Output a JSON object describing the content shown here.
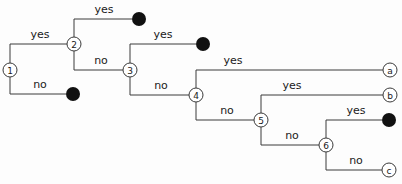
{
  "diagram": {
    "type": "binary-decision-tree",
    "width": 402,
    "height": 184,
    "background_color": "#fdfdfd",
    "line_color": "#3a3a3a",
    "text_color": "#1a1a1a",
    "filled_leaf_color": "#111111",
    "node_fill_color": "#ffffff"
  },
  "labels": {
    "yes": "yes",
    "no": "no"
  },
  "decision_nodes": [
    {
      "id": "n1",
      "label": "1",
      "x": 10,
      "y": 70,
      "r": 7
    },
    {
      "id": "n2",
      "label": "2",
      "x": 74,
      "y": 44,
      "r": 7
    },
    {
      "id": "n3",
      "label": "3",
      "x": 130,
      "y": 70,
      "r": 7
    },
    {
      "id": "n4",
      "label": "4",
      "x": 196,
      "y": 95,
      "r": 7
    },
    {
      "id": "n5",
      "label": "5",
      "x": 261,
      "y": 120,
      "r": 7
    },
    {
      "id": "n6",
      "label": "6",
      "x": 326,
      "y": 145,
      "r": 7
    }
  ],
  "open_leaves": [
    {
      "id": "la",
      "label": "a",
      "x": 390,
      "y": 70,
      "r": 7
    },
    {
      "id": "lb",
      "label": "b",
      "x": 390,
      "y": 95,
      "r": 7
    },
    {
      "id": "lc",
      "label": "c",
      "x": 389,
      "y": 170,
      "r": 7
    }
  ],
  "filled_leaves": [
    {
      "id": "d1",
      "x": 139,
      "y": 19,
      "r": 7
    },
    {
      "id": "d2",
      "x": 73,
      "y": 94,
      "r": 7
    },
    {
      "id": "d3",
      "x": 203,
      "y": 44,
      "r": 7
    },
    {
      "id": "d4",
      "x": 389,
      "y": 120,
      "r": 7
    }
  ],
  "edges": [
    {
      "id": "e1",
      "from": "n1",
      "to": "n2",
      "branch": "yes",
      "path": "M 10 63 L 10 44 L 67 44",
      "label_x": 40,
      "label_y": 38
    },
    {
      "id": "e2",
      "from": "n1",
      "to": "d2",
      "branch": "no",
      "path": "M 10 77 L 10 94 L 66 94",
      "label_x": 40,
      "label_y": 88
    },
    {
      "id": "e3",
      "from": "n2",
      "to": "d1",
      "branch": "yes",
      "path": "M 74 37 L 74 19 L 132 19",
      "label_x": 104,
      "label_y": 13
    },
    {
      "id": "e4",
      "from": "n2",
      "to": "n3",
      "branch": "no",
      "path": "M 74 51 L 74 70 L 123 70",
      "label_x": 101,
      "label_y": 64
    },
    {
      "id": "e5",
      "from": "n3",
      "to": "d3",
      "branch": "yes",
      "path": "M 130 63 L 130 44 L 196 44",
      "label_x": 163,
      "label_y": 38
    },
    {
      "id": "e6",
      "from": "n3",
      "to": "n4",
      "branch": "no",
      "path": "M 130 77 L 130 95 L 189 95",
      "label_x": 161,
      "label_y": 89
    },
    {
      "id": "e7",
      "from": "n4",
      "to": "la",
      "branch": "yes",
      "path": "M 196 88 L 196 70 L 383 70",
      "label_x": 233,
      "label_y": 64
    },
    {
      "id": "e8",
      "from": "n4",
      "to": "n5",
      "branch": "no",
      "path": "M 196 102 L 196 120 L 254 120",
      "label_x": 227,
      "label_y": 114
    },
    {
      "id": "e9",
      "from": "n5",
      "to": "lb",
      "branch": "yes",
      "path": "M 261 113 L 261 95 L 383 95",
      "label_x": 292,
      "label_y": 89
    },
    {
      "id": "e10",
      "from": "n5",
      "to": "n6",
      "branch": "no",
      "path": "M 261 127 L 261 145 L 319 145",
      "label_x": 292,
      "label_y": 139
    },
    {
      "id": "e11",
      "from": "n6",
      "to": "d4",
      "branch": "yes",
      "path": "M 326 138 L 326 120 L 382 120",
      "label_x": 356,
      "label_y": 114
    },
    {
      "id": "e12",
      "from": "n6",
      "to": "lc",
      "branch": "no",
      "path": "M 326 152 L 326 170 L 382 170",
      "label_x": 356,
      "label_y": 164
    }
  ]
}
